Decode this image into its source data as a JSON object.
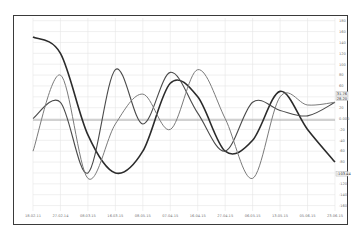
{
  "chart_data": {
    "type": "line",
    "title": "",
    "xlabel": "",
    "ylabel": "",
    "x": [
      "18.02.11",
      "27.02.14",
      "08.03.15",
      "16.03.15",
      "08.05.15",
      "07.04.15",
      "16.04.15",
      "27.04.15",
      "06.05.15",
      "13.05.15",
      "05.06.15",
      "23.06.15"
    ],
    "y_ticks": [
      180,
      160,
      140,
      120,
      100,
      80,
      60,
      40,
      20,
      "0.000",
      -20,
      -40,
      -60,
      -80,
      -100,
      -120,
      -140,
      -160
    ],
    "ylim": [
      -170,
      185
    ],
    "grid": true,
    "legend": "none",
    "zero_line": true,
    "series": [
      {
        "name": "Series 1 (dark, slow wave)",
        "color": "#2b2b2b",
        "values": [
          150,
          120,
          -30,
          -100,
          -60,
          65,
          40,
          -60,
          -40,
          50,
          -20,
          -80
        ]
      },
      {
        "name": "Series 2 (medium, spiky)",
        "color": "#4a4a4a",
        "values": [
          0,
          30,
          -100,
          90,
          -10,
          85,
          10,
          -60,
          30,
          15,
          5,
          30
        ]
      },
      {
        "name": "Series 3 (light, oscillating)",
        "color": "#7a7a7a",
        "values": [
          -60,
          80,
          -110,
          -10,
          45,
          -20,
          90,
          0,
          -110,
          40,
          25,
          30
        ]
      }
    ],
    "value_badges": [
      "31.76",
      "28.20",
      "-103.44"
    ]
  }
}
